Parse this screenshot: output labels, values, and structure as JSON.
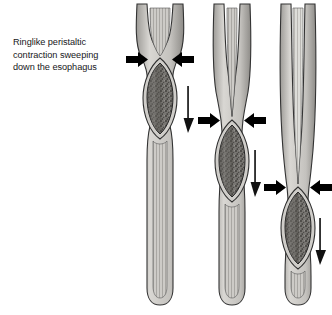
{
  "figure": {
    "title": "Ringlike peristaltic contraction sweeping down the esophagus",
    "caption_lines": [
      "Ringlike peristaltic",
      "contraction sweeping",
      "down the esophagus"
    ],
    "background_color": "#ffffff",
    "ink_color": "#1a1a1a",
    "wall_color": "#b4b2ae",
    "wall_light_color": "#d8d6d2",
    "lumen_color": "#c9c7c3",
    "bolus_color": "#6e6c68",
    "bolus_dark_color": "#4a4845",
    "outline_color": "#2b2b2b",
    "panels": [
      {
        "name": "panel-1",
        "label": "esophagus-stage-1",
        "constriction_y": 60,
        "bolus_center_y": 97,
        "direction_arrow_y": 100,
        "description": "Ringlike contraction at upper esophagus with bolus immediately below"
      },
      {
        "name": "panel-2",
        "label": "esophagus-stage-2",
        "constriction_y": 121,
        "bolus_center_y": 160,
        "direction_arrow_y": 163,
        "description": "Contraction ring has swept to mid esophagus, bolus pushed downward"
      },
      {
        "name": "panel-3",
        "label": "esophagus-stage-3",
        "constriction_y": 188,
        "bolus_center_y": 228,
        "direction_arrow_y": 232,
        "description": "Contraction ring near lower esophagus, bolus approaching stomach"
      }
    ],
    "annotations": {
      "contraction_arrows_label": "ringlike contraction arrows",
      "direction_arrow_label": "direction of wave travel"
    }
  }
}
